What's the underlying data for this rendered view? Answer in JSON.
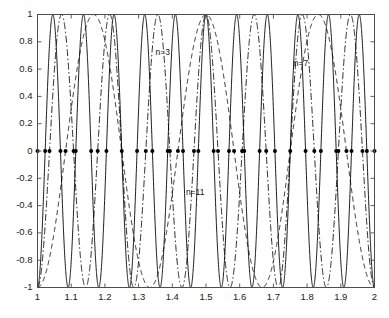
{
  "chart_data": {
    "type": "line",
    "title": "",
    "xlabel": "",
    "ylabel": "",
    "xlim": [
      1,
      2
    ],
    "ylim": [
      -1,
      1
    ],
    "grid": false,
    "legend": "inline-annotations",
    "xticks": [
      1,
      1.1,
      1.2,
      1.3,
      1.4,
      1.5,
      1.6,
      1.7,
      1.8,
      1.9,
      2
    ],
    "xtick_labels": [
      "1",
      "1.1",
      "1.2",
      "1.3",
      "1.4",
      "1.5",
      "1.6",
      "1.7",
      "1.8",
      "1.9",
      "2"
    ],
    "yticks": [
      -1,
      -0.8,
      -0.6,
      -0.4,
      -0.2,
      0,
      0.2,
      0.4,
      0.6,
      0.8,
      1
    ],
    "ytick_labels": [
      "-1",
      "-0.8",
      "-0.6",
      "-0.4",
      "-0.2",
      "0",
      "0.2",
      "0.4",
      "0.6",
      "0.8",
      "1"
    ],
    "series": [
      {
        "name": "n=3",
        "label": "n=3",
        "linestyle": "dashed",
        "color": "#000000",
        "formula": "cos(3*pi*(x-1.5)*2)",
        "cycles_over_domain": 3,
        "peak_x": 1.5,
        "peak_y": 1,
        "label_x": 1.38,
        "label_y": 0.72,
        "zeros": [
          1.0833,
          1.25,
          1.4167,
          1.5833,
          1.75,
          1.9167
        ]
      },
      {
        "name": "n=7",
        "label": "n=7",
        "linestyle": "dashdot",
        "color": "#000000",
        "formula": "cos(7*pi*(x-1.5)*2)",
        "cycles_over_domain": 7,
        "peak_x": 1.5,
        "peak_y": 1,
        "label_x": 1.79,
        "label_y": 0.64,
        "zeros": [
          1.0357,
          1.1071,
          1.1786,
          1.25,
          1.3214,
          1.3929,
          1.4643,
          1.5357,
          1.6071,
          1.6786,
          1.75,
          1.8214,
          1.8929,
          1.9643
        ]
      },
      {
        "name": "n=11",
        "label": "n=11",
        "linestyle": "solid",
        "color": "#000000",
        "formula": "cos(11*pi*(x-1.5)*2)",
        "cycles_over_domain": 11,
        "peak_x": 1.5,
        "peak_y": 1,
        "label_x": 1.47,
        "label_y": -0.31,
        "zeros": [
          1.0227,
          1.0682,
          1.1136,
          1.1591,
          1.2045,
          1.25,
          1.2955,
          1.3409,
          1.3864,
          1.4318,
          1.4773,
          1.5227,
          1.5682,
          1.6136,
          1.6591,
          1.7045,
          1.75,
          1.7955,
          1.8409,
          1.8864,
          1.9318,
          1.9773
        ]
      }
    ],
    "markers": {
      "name": "zero-crossing-markers",
      "shape": "dot",
      "color": "#000000",
      "y": 0,
      "x_values": [
        1.0,
        1.0227,
        1.0357,
        1.0682,
        1.0833,
        1.1071,
        1.1136,
        1.1591,
        1.1786,
        1.2045,
        1.25,
        1.2955,
        1.3214,
        1.3409,
        1.3864,
        1.3929,
        1.4167,
        1.4318,
        1.4643,
        1.4773,
        1.5227,
        1.5357,
        1.5682,
        1.5833,
        1.6071,
        1.6136,
        1.6591,
        1.6786,
        1.7045,
        1.75,
        1.7955,
        1.8214,
        1.8409,
        1.8864,
        1.8929,
        1.9167,
        1.9318,
        1.9643,
        1.9773,
        2.0
      ]
    }
  },
  "axes": {
    "frame_color": "#4d4d4d",
    "background": "#ffffff"
  }
}
